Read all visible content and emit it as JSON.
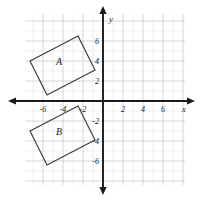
{
  "figure": {
    "type": "coordinate-plane",
    "background": "#ffffff",
    "grid_color": "#c9c9cf",
    "axis_color": "#1a1a1a",
    "shape_color": "#3a3a3a"
  },
  "axes": {
    "x_axis_label": "x",
    "y_axis_label": "y",
    "x_ticks": [
      "-6",
      "-4",
      "-2",
      "2",
      "4",
      "6"
    ],
    "y_ticks": [
      "6",
      "4",
      "2",
      "-2",
      "-4",
      "-6"
    ],
    "x_range": [
      -8,
      8
    ],
    "y_range": [
      -8,
      8
    ],
    "grid": true,
    "tick_step": 2
  },
  "shapes": [
    {
      "label": "A",
      "kind": "rectangle",
      "label_point": [
        -4.4,
        3.6
      ],
      "vertices": [
        [
          -7.3,
          4.0
        ],
        [
          -2.5,
          6.5
        ],
        [
          -0.8,
          3.1
        ],
        [
          -5.6,
          0.6
        ]
      ]
    },
    {
      "label": "B",
      "kind": "rectangle",
      "label_point": [
        -4.4,
        -3.4
      ],
      "vertices": [
        [
          -7.3,
          -3.0
        ],
        [
          -2.5,
          -0.5
        ],
        [
          -0.8,
          -3.9
        ],
        [
          -5.6,
          -6.4
        ]
      ]
    }
  ]
}
